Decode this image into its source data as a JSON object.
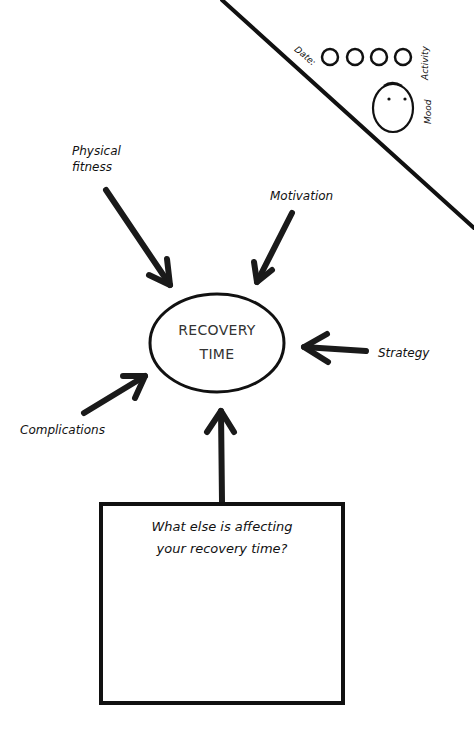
{
  "center": {
    "line1": "RECOVERY",
    "line2": "TIME"
  },
  "factors": [
    {
      "id": "physical-fitness",
      "line1": "Physical",
      "line2": "fitness"
    },
    {
      "id": "motivation",
      "label": "Motivation"
    },
    {
      "id": "strategy",
      "label": "Strategy"
    },
    {
      "id": "complications",
      "label": "Complications"
    }
  ],
  "prompt": {
    "line1": "What else is affecting",
    "line2": "your recovery time?"
  },
  "tracker": {
    "date_label": "Date:",
    "activity_label": "Activity",
    "mood_label": "Mood",
    "activity_circles": 4
  },
  "colors": {
    "ink": "#111111",
    "background": "#ffffff",
    "center_text": "#333333"
  }
}
